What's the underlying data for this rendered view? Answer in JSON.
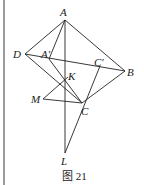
{
  "figure": {
    "caption": "图 21",
    "border_left_x": 4,
    "stroke_color": "#222222",
    "background": "#ffffff"
  },
  "points": {
    "A": {
      "label": "A",
      "x": 65,
      "y": 20,
      "lx": 60,
      "ly": 16
    },
    "D": {
      "label": "D",
      "x": 25,
      "y": 54,
      "lx": 13,
      "ly": 58
    },
    "A1": {
      "label": "A′",
      "x": 49,
      "y": 59,
      "lx": 41,
      "ly": 58
    },
    "C1": {
      "label": "C′",
      "x": 100,
      "y": 66,
      "lx": 94,
      "ly": 66
    },
    "B": {
      "label": "B",
      "x": 125,
      "y": 71,
      "lx": 127,
      "ly": 76
    },
    "K": {
      "label": "K",
      "x": 65,
      "y": 80,
      "lx": 68,
      "ly": 80
    },
    "M": {
      "label": "M",
      "x": 43,
      "y": 99,
      "lx": 31,
      "ly": 103
    },
    "C": {
      "label": "C",
      "x": 82,
      "y": 103,
      "lx": 81,
      "ly": 115
    },
    "L": {
      "label": "L",
      "x": 65,
      "y": 153,
      "lx": 61,
      "ly": 165
    }
  },
  "segments": [
    [
      "A",
      "D"
    ],
    [
      "A",
      "B"
    ],
    [
      "D",
      "B"
    ],
    [
      "A",
      "L"
    ],
    [
      "A",
      "A1"
    ],
    [
      "A1",
      "C"
    ],
    [
      "D",
      "C"
    ],
    [
      "B",
      "C"
    ],
    [
      "C1",
      "L"
    ],
    [
      "M",
      "K"
    ],
    [
      "M",
      "C"
    ]
  ]
}
